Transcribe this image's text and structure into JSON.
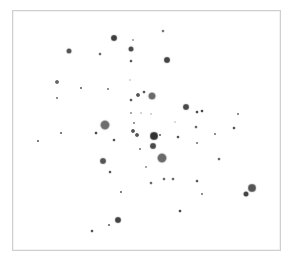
{
  "chart_data": {
    "type": "scatter",
    "title": "",
    "xlabel": "",
    "ylabel": "",
    "grid": false,
    "legend": null,
    "frame": {
      "x": 12,
      "y": 10,
      "width": 269,
      "height": 241,
      "border_color": "#cfcfcf"
    },
    "coordinate_space": "pixel (image coordinates, origin top-left)",
    "point_color": "#4a4a4a",
    "points": [
      {
        "x": 114,
        "y": 38,
        "size": 6,
        "shade": "#3f3f3f"
      },
      {
        "x": 163,
        "y": 31,
        "size": 3,
        "shade": "#7a7a7a"
      },
      {
        "x": 133,
        "y": 40,
        "size": 2,
        "shade": "#9a9a9a"
      },
      {
        "x": 131,
        "y": 49,
        "size": 5,
        "shade": "#4a4a4a"
      },
      {
        "x": 131,
        "y": 61,
        "size": 3,
        "shade": "#5a5a5a"
      },
      {
        "x": 167,
        "y": 60,
        "size": 6,
        "shade": "#444444"
      },
      {
        "x": 69,
        "y": 51,
        "size": 5,
        "shade": "#555555"
      },
      {
        "x": 100,
        "y": 54,
        "size": 3,
        "shade": "#6a6a6a"
      },
      {
        "x": 57,
        "y": 82,
        "size": 4,
        "shade": "#666666"
      },
      {
        "x": 81,
        "y": 88,
        "size": 2,
        "shade": "#555555"
      },
      {
        "x": 108,
        "y": 89,
        "size": 2,
        "shade": "#6a6a6a"
      },
      {
        "x": 57,
        "y": 98,
        "size": 2,
        "shade": "#6a6a6a"
      },
      {
        "x": 130,
        "y": 80,
        "size": 2,
        "shade": "#cfcfcf"
      },
      {
        "x": 131,
        "y": 100,
        "size": 3,
        "shade": "#5a5a5a"
      },
      {
        "x": 138,
        "y": 95,
        "size": 4,
        "shade": "#555555"
      },
      {
        "x": 144,
        "y": 92,
        "size": 3,
        "shade": "#555555"
      },
      {
        "x": 152,
        "y": 96,
        "size": 7,
        "shade": "#6a6a6a"
      },
      {
        "x": 186,
        "y": 107,
        "size": 6,
        "shade": "#4a4a4a"
      },
      {
        "x": 197,
        "y": 112,
        "size": 3,
        "shade": "#4a4a4a"
      },
      {
        "x": 202,
        "y": 111,
        "size": 3,
        "shade": "#4a4a4a"
      },
      {
        "x": 238,
        "y": 114,
        "size": 2,
        "shade": "#6a6a6a"
      },
      {
        "x": 131,
        "y": 113,
        "size": 2,
        "shade": "#8a8a8a"
      },
      {
        "x": 141,
        "y": 113,
        "size": 2,
        "shade": "#c8c8c8"
      },
      {
        "x": 151,
        "y": 114,
        "size": 2,
        "shade": "#c8c8c8"
      },
      {
        "x": 175,
        "y": 122,
        "size": 2,
        "shade": "#d0d0d0"
      },
      {
        "x": 105,
        "y": 125,
        "size": 9,
        "shade": "#6e6e6e"
      },
      {
        "x": 134,
        "y": 123,
        "size": 2,
        "shade": "#7a7a7a"
      },
      {
        "x": 96,
        "y": 133,
        "size": 3,
        "shade": "#4a4a4a"
      },
      {
        "x": 133,
        "y": 131,
        "size": 4,
        "shade": "#555555"
      },
      {
        "x": 137,
        "y": 135,
        "size": 4,
        "shade": "#555555"
      },
      {
        "x": 154,
        "y": 136,
        "size": 8,
        "shade": "#333333"
      },
      {
        "x": 160,
        "y": 135,
        "size": 2,
        "shade": "#555555"
      },
      {
        "x": 178,
        "y": 137,
        "size": 3,
        "shade": "#555555"
      },
      {
        "x": 196,
        "y": 127,
        "size": 3,
        "shade": "#6a6a6a"
      },
      {
        "x": 215,
        "y": 134,
        "size": 2,
        "shade": "#6a6a6a"
      },
      {
        "x": 234,
        "y": 128,
        "size": 3,
        "shade": "#555555"
      },
      {
        "x": 114,
        "y": 140,
        "size": 3,
        "shade": "#555555"
      },
      {
        "x": 38,
        "y": 141,
        "size": 2,
        "shade": "#555555"
      },
      {
        "x": 61,
        "y": 133,
        "size": 2,
        "shade": "#555555"
      },
      {
        "x": 153,
        "y": 146,
        "size": 6,
        "shade": "#4a4a4a"
      },
      {
        "x": 140,
        "y": 149,
        "size": 2,
        "shade": "#6a6a6a"
      },
      {
        "x": 197,
        "y": 143,
        "size": 2,
        "shade": "#6a6a6a"
      },
      {
        "x": 162,
        "y": 158,
        "size": 9,
        "shade": "#6a6a6a"
      },
      {
        "x": 219,
        "y": 159,
        "size": 3,
        "shade": "#6a6a6a"
      },
      {
        "x": 103,
        "y": 161,
        "size": 6,
        "shade": "#555555"
      },
      {
        "x": 110,
        "y": 172,
        "size": 3,
        "shade": "#5a5a5a"
      },
      {
        "x": 146,
        "y": 167,
        "size": 2,
        "shade": "#8a8a8a"
      },
      {
        "x": 151,
        "y": 183,
        "size": 3,
        "shade": "#6a6a6a"
      },
      {
        "x": 164,
        "y": 179,
        "size": 3,
        "shade": "#6a6a6a"
      },
      {
        "x": 173,
        "y": 179,
        "size": 3,
        "shade": "#6a6a6a"
      },
      {
        "x": 197,
        "y": 181,
        "size": 3,
        "shade": "#5a5a5a"
      },
      {
        "x": 202,
        "y": 194,
        "size": 2,
        "shade": "#6a6a6a"
      },
      {
        "x": 121,
        "y": 192,
        "size": 2,
        "shade": "#5a5a5a"
      },
      {
        "x": 180,
        "y": 211,
        "size": 3,
        "shade": "#4a4a4a"
      },
      {
        "x": 252,
        "y": 188,
        "size": 8,
        "shade": "#555555"
      },
      {
        "x": 246,
        "y": 194,
        "size": 5,
        "shade": "#444444"
      },
      {
        "x": 118,
        "y": 220,
        "size": 6,
        "shade": "#444444"
      },
      {
        "x": 109,
        "y": 225,
        "size": 2,
        "shade": "#5a5a5a"
      },
      {
        "x": 92,
        "y": 231,
        "size": 3,
        "shade": "#555555"
      }
    ]
  }
}
